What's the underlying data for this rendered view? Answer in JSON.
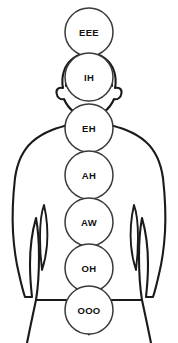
{
  "diagram": {
    "figure_name": "human-body-front-silhouette",
    "orientation": "front-view",
    "background_color": "#ffffff",
    "outline_color": "#1a1a1a",
    "circle_fill": "#ffffff",
    "circle_stroke": "#3a3a3a",
    "label_color": "#111111",
    "arrow": {
      "name": "upward-arrow-icon",
      "direction": "up",
      "color": "#1a1a1a"
    },
    "nodes": [
      {
        "id": "node-eee",
        "label": "EEE",
        "cx": 89,
        "cy": 32,
        "r": 24,
        "region": "above-head"
      },
      {
        "id": "node-ih",
        "label": "IH",
        "cx": 89,
        "cy": 77,
        "r": 24,
        "region": "head"
      },
      {
        "id": "node-eh",
        "label": "EH",
        "cx": 89,
        "cy": 128,
        "r": 24,
        "region": "throat"
      },
      {
        "id": "node-ah",
        "label": "AH",
        "cx": 89,
        "cy": 175,
        "r": 24,
        "region": "chest"
      },
      {
        "id": "node-aw",
        "label": "AW",
        "cx": 89,
        "cy": 222,
        "r": 24,
        "region": "upper-abdomen"
      },
      {
        "id": "node-oh",
        "label": "OH",
        "cx": 89,
        "cy": 268,
        "r": 24,
        "region": "lower-abdomen"
      },
      {
        "id": "node-ooo",
        "label": "OOO",
        "cx": 89,
        "cy": 310,
        "r": 24,
        "region": "pelvis"
      }
    ]
  }
}
